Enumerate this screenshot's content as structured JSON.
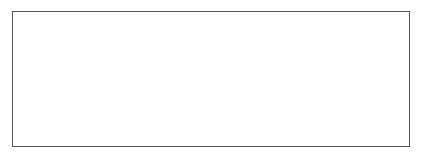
{
  "page_number": "1",
  "chart_data": [
    {
      "type": "scatter",
      "panel": "(i)",
      "xlabel": "n",
      "ylabel": "u_n",
      "xlim": [
        0,
        6
      ],
      "ylim": [
        0,
        6
      ],
      "xticks": [
        "0",
        "1",
        "2",
        "3",
        "4",
        "5",
        "6"
      ],
      "yticks": [
        "1",
        "2",
        "3",
        "4",
        "5",
        "6"
      ],
      "grid": true,
      "points": [
        [
          1,
          1
        ],
        [
          2,
          3
        ],
        [
          3,
          5
        ]
      ]
    },
    {
      "type": "scatter",
      "panel": "(ii)",
      "xlabel": "n",
      "ylabel": "u_n",
      "xlim": [
        0,
        6
      ],
      "ylim": [
        0,
        600
      ],
      "xticks": [
        "0",
        "1",
        "2",
        "3",
        "4",
        "5",
        "6"
      ],
      "yticks": [
        "100",
        "200",
        "300",
        "400",
        "500",
        "600"
      ],
      "grid": true,
      "points": [
        [
          1,
          500
        ],
        [
          2,
          400
        ],
        [
          3,
          320
        ],
        [
          4,
          256
        ]
      ]
    },
    {
      "type": "scatter",
      "panel": "(iii)",
      "xlabel": "n",
      "ylabel": "u_n",
      "xlim": [
        0,
        6
      ],
      "ylim": [
        0,
        6
      ],
      "xticks": [
        "0",
        "1",
        "2",
        "3",
        "4",
        "5",
        "6"
      ],
      "yticks": [
        "1",
        "2",
        "3",
        "4",
        "5",
        "6"
      ],
      "grid": true,
      "points": [
        [
          1,
          1
        ],
        [
          2,
          1
        ],
        [
          3,
          2
        ],
        [
          4,
          3
        ],
        [
          5,
          5
        ]
      ]
    }
  ]
}
